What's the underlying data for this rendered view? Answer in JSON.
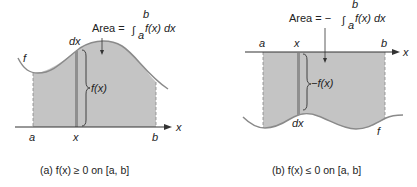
{
  "panels": [
    {
      "id": "a",
      "area_label_prefix": "Area =",
      "integral_sign": "∫",
      "upper_limit": "b",
      "lower_limit": "a",
      "integrand": "f(x) dx",
      "height_label": "f(x)",
      "dx_label": "dx",
      "curve_label": "f",
      "axis_label": "x",
      "a_label": "a",
      "x_label": "x",
      "b_label": "b",
      "caption": "(a) f(x) ≥ 0 on [a, b]"
    },
    {
      "id": "b",
      "area_label_prefix": "Area = −",
      "integral_sign": "∫",
      "upper_limit": "b",
      "lower_limit": "a",
      "integrand": "f(x) dx",
      "height_label": "−f(x)",
      "dx_label": "dx",
      "curve_label": "f",
      "axis_label": "x",
      "a_label": "a",
      "x_label": "x",
      "b_label": "b",
      "caption": "(b) f(x) ≤ 0 on [a, b]"
    }
  ],
  "colors": {
    "fill": "#c4c4c4",
    "curve": "#8a8a8a",
    "axis": "#333333",
    "strip": "#8f8f8f"
  }
}
